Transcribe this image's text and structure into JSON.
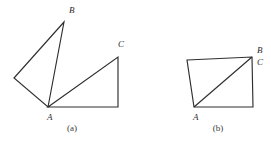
{
  "figure": {
    "stroke_color": "#2e2e2e",
    "label_color": "#2b2b2b",
    "background_color": "#ffffff",
    "panels": [
      {
        "caption": "(a)",
        "caption_pos": [
          72,
          131
        ],
        "vertex_labels": [
          {
            "text": "B",
            "x": 69,
            "y": 13
          },
          {
            "text": "C",
            "x": 118,
            "y": 47
          },
          {
            "text": "A",
            "x": 47,
            "y": 120
          }
        ],
        "shapes": [
          {
            "name": "left-triangle-ab",
            "type": "polygon",
            "points": "64,22 14,78 48,107 64,22"
          },
          {
            "name": "right-triangle-ac",
            "type": "polygon",
            "points": "48,107 118,57 118,107 48,107"
          }
        ]
      },
      {
        "caption": "(b)",
        "caption_pos": [
          218,
          131
        ],
        "vertex_labels": [
          {
            "text": "B",
            "x": 257,
            "y": 53
          },
          {
            "text": "C",
            "x": 257,
            "y": 65
          },
          {
            "text": "A",
            "x": 193,
            "y": 120
          }
        ],
        "shapes": [
          {
            "name": "quadrilateral-abcd",
            "type": "polygon",
            "points": "187,60 252,57 253,107 194,107 187,60"
          },
          {
            "name": "diagonal-a-to-b",
            "type": "line",
            "points": "194,107 252,57"
          }
        ]
      }
    ]
  }
}
